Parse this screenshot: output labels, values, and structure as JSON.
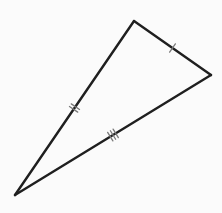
{
  "figure": {
    "type": "triangle",
    "colors": {
      "background": "#fbfbfb",
      "stroke": "#1f1f1f",
      "tick": "#7a7a7a"
    },
    "vertices": {
      "top": [
        134,
        21
      ],
      "right": [
        211,
        75
      ],
      "bottom_left": [
        15,
        195
      ]
    },
    "sides": [
      {
        "name": "top-right",
        "from": "top",
        "to": "right",
        "tick_count": 1
      },
      {
        "name": "left",
        "from": "top",
        "to": "bottom_left",
        "tick_count": 2
      },
      {
        "name": "bottom",
        "from": "bottom_left",
        "to": "right",
        "tick_count": 3
      }
    ]
  }
}
